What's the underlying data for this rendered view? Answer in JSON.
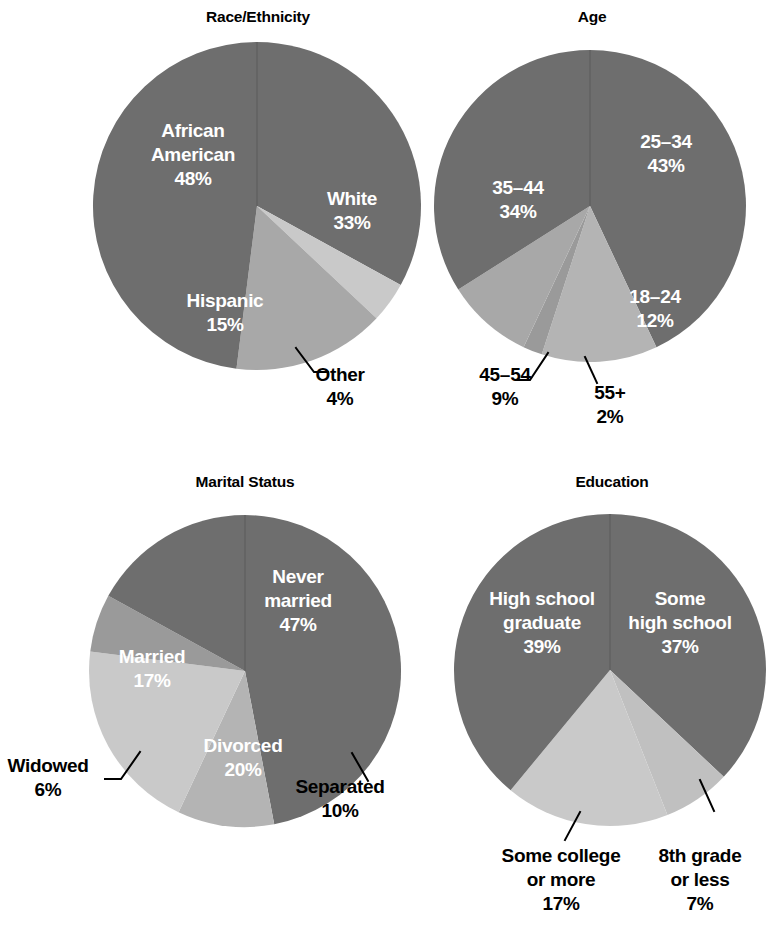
{
  "page": {
    "background": "#ffffff",
    "width": 780,
    "height": 931
  },
  "palette": {
    "slice_darkest": "#6e6e6e",
    "slice_dark": "#808080",
    "slice_mid": "#9a9a9a",
    "slice_light": "#b4b4b4",
    "slice_lightest": "#c9c9c9",
    "inner_label_color": "#ffffff",
    "outer_label_color": "#000000",
    "title_color": "#000000"
  },
  "charts": [
    {
      "id": "race-ethnicity",
      "title": "Race/Ethnicity",
      "title_x": 258,
      "title_y": 22,
      "cx": 257,
      "cy": 206,
      "r": 164,
      "start_angle": 0,
      "slices": [
        {
          "label": "White",
          "value": 33,
          "value_label": "33%",
          "color": "#6e6e6e",
          "label_placement": "inside",
          "label_lines": [
            "White",
            "33%"
          ],
          "label_x": 352,
          "label_y": 205
        },
        {
          "label": "Other",
          "value": 4,
          "value_label": "4%",
          "color": "#c9c9c9",
          "label_placement": "outside",
          "label_lines": [
            "Other",
            "4%"
          ],
          "label_x": 340,
          "label_y": 381,
          "leader": [
            [
              296,
              348
            ],
            [
              314,
              372
            ],
            [
              328,
              372
            ]
          ]
        },
        {
          "label": "Hispanic",
          "value": 15,
          "value_label": "15%",
          "color": "#a8a8a8",
          "label_placement": "inside",
          "label_lines": [
            "Hispanic",
            "15%"
          ],
          "label_x": 225,
          "label_y": 307,
          "label_color": "#000000"
        },
        {
          "label": "African American",
          "value": 48,
          "value_label": "48%",
          "color": "#6e6e6e",
          "label_placement": "inside",
          "label_lines": [
            "African",
            "American",
            "48%"
          ],
          "label_x": 193,
          "label_y": 137
        }
      ]
    },
    {
      "id": "age",
      "title": "Age",
      "title_x": 592,
      "title_y": 22,
      "cx": 590,
      "cy": 206,
      "r": 156,
      "start_angle": 0,
      "slices": [
        {
          "label": "25–34",
          "value": 43,
          "value_label": "43%",
          "color": "#6e6e6e",
          "label_placement": "inside",
          "label_lines": [
            "25–34",
            "43%"
          ],
          "label_x": 666,
          "label_y": 148
        },
        {
          "label": "18–24",
          "value": 12,
          "value_label": "12%",
          "color": "#b4b4b4",
          "label_placement": "inside",
          "label_lines": [
            "18–24",
            "12%"
          ],
          "label_x": 655,
          "label_y": 303
        },
        {
          "label": "55+",
          "value": 2,
          "value_label": "2%",
          "color": "#9a9a9a",
          "label_placement": "outside",
          "label_lines": [
            "55+",
            "2%"
          ],
          "label_x": 610,
          "label_y": 399,
          "leader": [
            [
              585,
              357
            ],
            [
              597,
              383
            ]
          ]
        },
        {
          "label": "45–54",
          "value": 9,
          "value_label": "9%",
          "color": "#a8a8a8",
          "label_placement": "outside",
          "label_lines": [
            "45–54",
            "9%"
          ],
          "label_x": 505,
          "label_y": 381,
          "leader": [
            [
              548,
              353
            ],
            [
              530,
              380
            ],
            [
              517,
              380
            ]
          ]
        },
        {
          "label": "35–44",
          "value": 34,
          "value_label": "34%",
          "color": "#6e6e6e",
          "label_placement": "inside",
          "label_lines": [
            "35–44",
            "34%"
          ],
          "label_x": 518,
          "label_y": 194
        }
      ]
    },
    {
      "id": "marital-status",
      "title": "Marital Status",
      "title_x": 245,
      "title_y": 487,
      "cx": 245,
      "cy": 671,
      "r": 156,
      "start_angle": 0,
      "slices": [
        {
          "label": "Never married",
          "value": 47,
          "value_label": "47%",
          "color": "#6e6e6e",
          "label_placement": "inside",
          "label_lines": [
            "Never",
            "married",
            "47%"
          ],
          "label_x": 298,
          "label_y": 583
        },
        {
          "label": "Separated",
          "value": 10,
          "value_label": "10%",
          "color": "#b4b4b4",
          "label_placement": "outside",
          "label_lines": [
            "Separated",
            "10%"
          ],
          "label_x": 340,
          "label_y": 793,
          "leader": [
            [
              352,
              753
            ],
            [
              368,
              781
            ]
          ]
        },
        {
          "label": "Divorced",
          "value": 20,
          "value_label": "20%",
          "color": "#c9c9c9",
          "label_placement": "inside",
          "label_lines": [
            "Divorced",
            "20%"
          ],
          "label_x": 243,
          "label_y": 752
        },
        {
          "label": "Widowed",
          "value": 6,
          "value_label": "6%",
          "color": "#9a9a9a",
          "label_placement": "outside",
          "label_lines": [
            "Widowed",
            "6%"
          ],
          "label_x": 48,
          "label_y": 772,
          "leader": [
            [
              140,
              752
            ],
            [
              121,
              779
            ],
            [
              105,
              779
            ]
          ]
        },
        {
          "label": "Married",
          "value": 17,
          "value_label": "17%",
          "color": "#6e6e6e",
          "label_placement": "inside",
          "label_lines": [
            "Married",
            "17%"
          ],
          "label_x": 152,
          "label_y": 663
        }
      ]
    },
    {
      "id": "education",
      "title": "Education",
      "title_x": 612,
      "title_y": 487,
      "cx": 610,
      "cy": 670,
      "r": 156,
      "start_angle": 0,
      "slices": [
        {
          "label": "Some high school",
          "value": 37,
          "value_label": "37%",
          "color": "#6e6e6e",
          "label_placement": "inside",
          "label_lines": [
            "Some",
            "high school",
            "37%"
          ],
          "label_x": 680,
          "label_y": 605
        },
        {
          "label": "8th grade or less",
          "value": 7,
          "value_label": "7%",
          "color": "#c0c0c0",
          "label_placement": "outside",
          "label_lines": [
            "8th grade",
            "or less",
            "7%"
          ],
          "label_x": 700,
          "label_y": 862,
          "leader": [
            [
              700,
              780
            ],
            [
              714,
              811
            ]
          ]
        },
        {
          "label": "Some college or more",
          "value": 17,
          "value_label": "17%",
          "color": "#c9c9c9",
          "label_placement": "outside",
          "label_lines": [
            "Some college",
            "or more",
            "17%"
          ],
          "label_x": 561,
          "label_y": 862,
          "leader": [
            [
              580,
              812
            ],
            [
              565,
              840
            ]
          ]
        },
        {
          "label": "High school graduate",
          "value": 39,
          "value_label": "39%",
          "color": "#6e6e6e",
          "label_placement": "inside",
          "label_lines": [
            "High school",
            "graduate",
            "39%"
          ],
          "label_x": 542,
          "label_y": 605
        }
      ]
    }
  ],
  "chart_data": [
    {
      "type": "pie",
      "title": "Race/Ethnicity",
      "categories": [
        "White",
        "Other",
        "Hispanic",
        "African American"
      ],
      "values": [
        33,
        4,
        15,
        48
      ],
      "units": "percent",
      "direction": "clockwise",
      "start_angle_deg": 0,
      "legend": "none (labels on slices)",
      "colors": [
        "#6e6e6e",
        "#c9c9c9",
        "#a8a8a8",
        "#6e6e6e"
      ]
    },
    {
      "type": "pie",
      "title": "Age",
      "categories": [
        "25–34",
        "18–24",
        "55+",
        "45–54",
        "35–44"
      ],
      "values": [
        43,
        12,
        2,
        9,
        34
      ],
      "units": "percent",
      "direction": "clockwise",
      "start_angle_deg": 0,
      "legend": "none (labels on slices)",
      "colors": [
        "#6e6e6e",
        "#b4b4b4",
        "#9a9a9a",
        "#a8a8a8",
        "#6e6e6e"
      ]
    },
    {
      "type": "pie",
      "title": "Marital Status",
      "categories": [
        "Never married",
        "Separated",
        "Divorced",
        "Widowed",
        "Married"
      ],
      "values": [
        47,
        10,
        20,
        6,
        17
      ],
      "units": "percent",
      "direction": "clockwise",
      "start_angle_deg": 0,
      "legend": "none (labels on slices)",
      "colors": [
        "#6e6e6e",
        "#b4b4b4",
        "#c9c9c9",
        "#9a9a9a",
        "#6e6e6e"
      ]
    },
    {
      "type": "pie",
      "title": "Education",
      "categories": [
        "Some high school",
        "8th grade or less",
        "Some college or more",
        "High school graduate"
      ],
      "values": [
        37,
        7,
        17,
        39
      ],
      "units": "percent",
      "direction": "clockwise",
      "start_angle_deg": 0,
      "legend": "none (labels on slices)",
      "colors": [
        "#6e6e6e",
        "#c0c0c0",
        "#c9c9c9",
        "#6e6e6e"
      ]
    }
  ]
}
